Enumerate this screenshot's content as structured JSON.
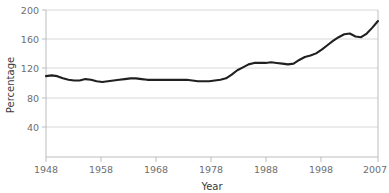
{
  "chart_data": {
    "type": "line",
    "title": "",
    "xlabel": "Year",
    "ylabel": "Percentage",
    "xlim": [
      1948,
      2007
    ],
    "ylim": [
      0,
      200
    ],
    "yticks": [
      40,
      80,
      120,
      160,
      200
    ],
    "xticks": [
      1948,
      1958,
      1968,
      1978,
      1988,
      1998,
      2007
    ],
    "grid": true,
    "legend": "none",
    "line_color": "#221f1f",
    "grid_color": "#d7d7d9",
    "axis_color": "#bcbdbf",
    "text_color": "#6d6e71",
    "series": [
      {
        "name": "Percentage",
        "x": [
          1948,
          1949,
          1950,
          1951,
          1952,
          1953,
          1954,
          1955,
          1956,
          1957,
          1958,
          1959,
          1960,
          1961,
          1962,
          1963,
          1964,
          1965,
          1966,
          1967,
          1968,
          1969,
          1970,
          1971,
          1972,
          1973,
          1974,
          1975,
          1976,
          1977,
          1978,
          1979,
          1980,
          1981,
          1982,
          1983,
          1984,
          1985,
          1986,
          1987,
          1988,
          1989,
          1990,
          1991,
          1992,
          1993,
          1994,
          1995,
          1996,
          1997,
          1998,
          1999,
          2000,
          2001,
          2002,
          2003,
          2004,
          2005,
          2006,
          2007
        ],
        "values": [
          110,
          111,
          110,
          107,
          105,
          104,
          104,
          106,
          105,
          103,
          102,
          103,
          104,
          105,
          106,
          107,
          107,
          106,
          105,
          105,
          105,
          105,
          105,
          105,
          105,
          105,
          104,
          103,
          103,
          103,
          104,
          105,
          107,
          112,
          118,
          122,
          126,
          128,
          128,
          128,
          129,
          128,
          127,
          126,
          127,
          132,
          136,
          138,
          141,
          146,
          152,
          158,
          163,
          167,
          168,
          164,
          163,
          168,
          176,
          185
        ]
      }
    ]
  },
  "axes": {
    "y_tick_labels": [
      "200",
      "160",
      "120",
      "80",
      "40"
    ],
    "x_tick_labels": [
      "1948",
      "1958",
      "1968",
      "1978",
      "1988",
      "1998",
      "2007"
    ],
    "y_axis_title": "Percentage",
    "x_axis_title": "Year"
  }
}
